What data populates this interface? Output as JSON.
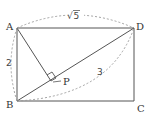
{
  "diagram": {
    "title": "",
    "colors": {
      "line": "#555555",
      "dashed": "#999999",
      "text": "#333333"
    },
    "points": {
      "A": {
        "label": "A",
        "x": 17,
        "y": 28
      },
      "B": {
        "label": "B",
        "x": 17,
        "y": 101
      },
      "C": {
        "label": "C",
        "x": 134,
        "y": 101
      },
      "D": {
        "label": "D",
        "x": 134,
        "y": 28
      },
      "P": {
        "label": "P",
        "x": 51,
        "y": 82
      }
    },
    "segments": [
      {
        "from": "A",
        "to": "D",
        "style": "solid"
      },
      {
        "from": "D",
        "to": "C",
        "style": "solid"
      },
      {
        "from": "C",
        "to": "B",
        "style": "solid"
      },
      {
        "from": "B",
        "to": "A",
        "style": "solid"
      },
      {
        "from": "B",
        "to": "D",
        "style": "solid"
      },
      {
        "from": "A",
        "to": "P",
        "style": "solid"
      }
    ],
    "measurements": {
      "AD": "√5",
      "AB": "2",
      "BD": "3"
    },
    "annotations": {
      "right_angle_at": "P",
      "sqrt5_label": "√",
      "sqrt5_radicand": "5"
    }
  }
}
